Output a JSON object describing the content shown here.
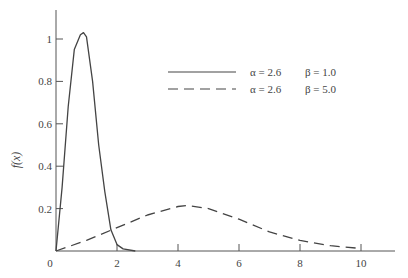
{
  "chart_data": {
    "type": "line",
    "title": "",
    "xlabel": "",
    "ylabel": "f(x)",
    "xlim": [
      0,
      11
    ],
    "ylim": [
      0,
      1.15
    ],
    "xticks": [
      0,
      2,
      4,
      6,
      8,
      10
    ],
    "xtick_labels": [
      "0",
      "2",
      "4",
      "6",
      "8",
      "10"
    ],
    "yticks": [
      0.2,
      0.4,
      0.6,
      0.8,
      1
    ],
    "ytick_labels": [
      "0.2",
      "0.4",
      "0.6",
      "0.8",
      "1"
    ],
    "grid": false,
    "legend_position": "upper right",
    "series": [
      {
        "name": "α = 2.6   β = 1.0",
        "alpha_label": "α = 2.6",
        "beta_label": "β = 1.0",
        "style": "solid",
        "x": [
          0,
          0.2,
          0.4,
          0.6,
          0.8,
          0.9,
          1.0,
          1.2,
          1.4,
          1.6,
          1.8,
          2.0,
          2.2,
          2.6
        ],
        "y": [
          0,
          0.3,
          0.68,
          0.95,
          1.02,
          1.03,
          1.01,
          0.8,
          0.5,
          0.28,
          0.1,
          0.03,
          0.01,
          0.0
        ]
      },
      {
        "name": "α = 2.6   β = 5.0",
        "alpha_label": "α = 2.6",
        "beta_label": "β = 5.0",
        "style": "dashed",
        "x": [
          0,
          1,
          2,
          3,
          4,
          4.3,
          5,
          6,
          7,
          8,
          9,
          10
        ],
        "y": [
          0,
          0.05,
          0.11,
          0.17,
          0.21,
          0.215,
          0.2,
          0.15,
          0.09,
          0.05,
          0.025,
          0.012
        ]
      }
    ]
  }
}
